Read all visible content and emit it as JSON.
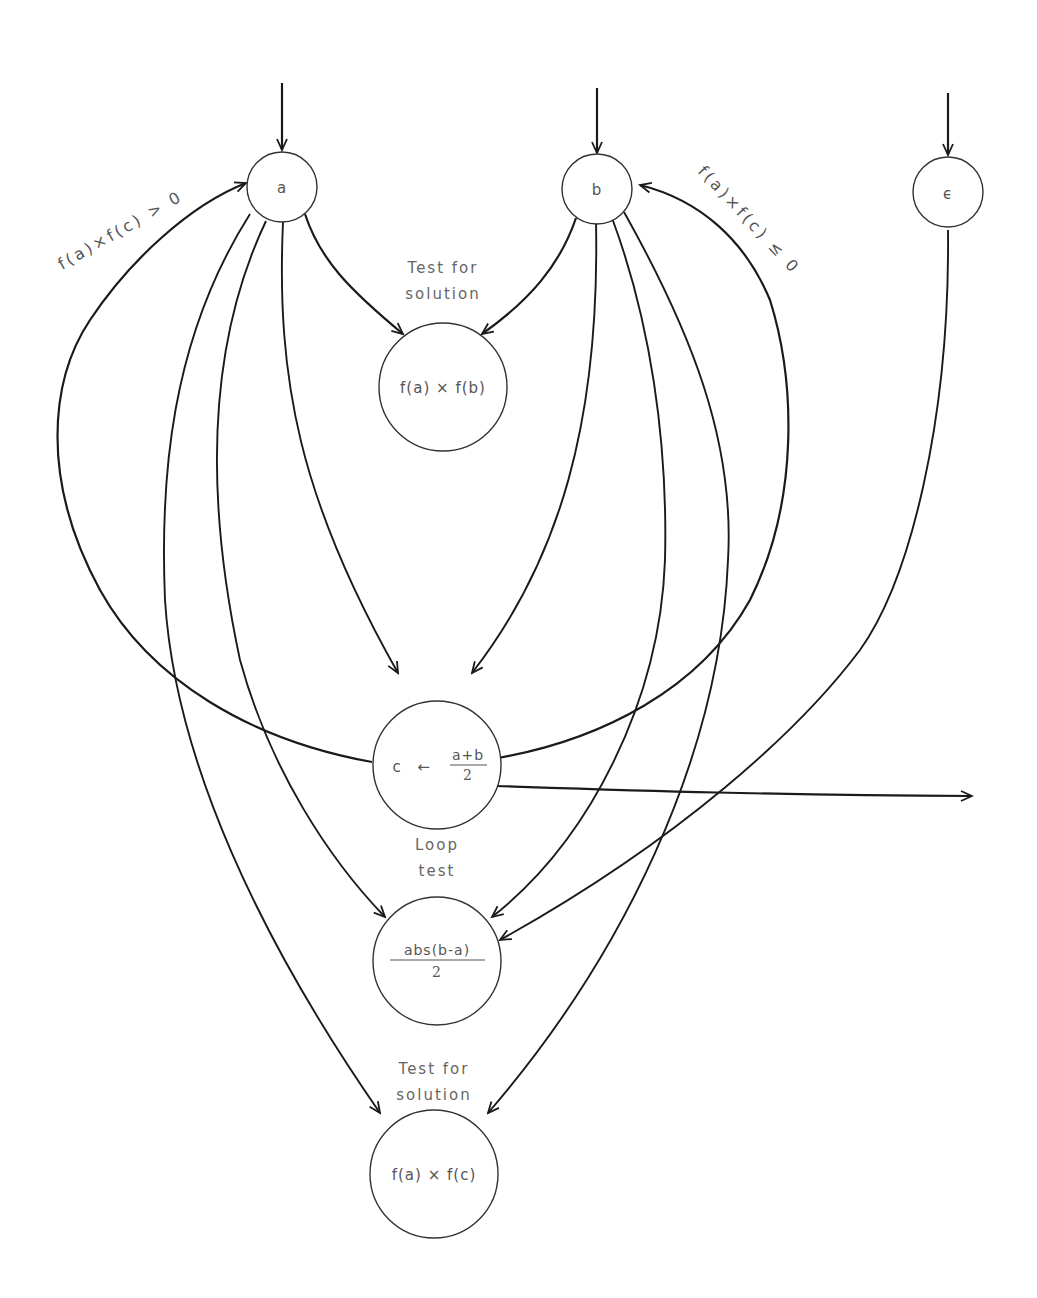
{
  "diagram": {
    "title": "",
    "nodes": {
      "a": {
        "label": "a"
      },
      "b": {
        "label": "b"
      },
      "epsilon": {
        "label": "ϵ"
      },
      "test1": {
        "caption_line1": "Test for",
        "caption_line2": "solution",
        "expr": "f(a) × f(b)"
      },
      "midpoint": {
        "lhs": "c",
        "arrow": "←",
        "numerator": "a+b",
        "denominator": "2"
      },
      "loop": {
        "caption_line1": "Loop",
        "caption_line2": "test",
        "numerator": "abs(b-a)",
        "denominator": "2"
      },
      "test2": {
        "caption_line1": "Test for",
        "caption_line2": "solution",
        "expr": "f(a) × f(c)"
      }
    },
    "edge_labels": {
      "to_a": "f(a)×f(c) > 0",
      "to_b": "f(a)×f(c) ≤ 0"
    },
    "edges": [
      {
        "from": "input",
        "to": "a"
      },
      {
        "from": "input",
        "to": "b"
      },
      {
        "from": "input",
        "to": "epsilon"
      },
      {
        "from": "a",
        "to": "test1"
      },
      {
        "from": "b",
        "to": "test1"
      },
      {
        "from": "a",
        "to": "midpoint"
      },
      {
        "from": "b",
        "to": "midpoint"
      },
      {
        "from": "a",
        "to": "loop"
      },
      {
        "from": "b",
        "to": "loop"
      },
      {
        "from": "epsilon",
        "to": "loop"
      },
      {
        "from": "a",
        "to": "test2"
      },
      {
        "from": "b",
        "to": "test2"
      },
      {
        "from": "midpoint",
        "to": "a",
        "condition": "f(a)×f(c) > 0"
      },
      {
        "from": "midpoint",
        "to": "b",
        "condition": "f(a)×f(c) ≤ 0"
      },
      {
        "from": "midpoint",
        "to": "output"
      }
    ]
  }
}
